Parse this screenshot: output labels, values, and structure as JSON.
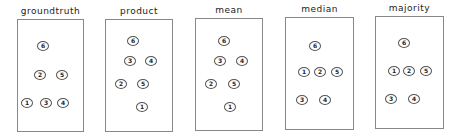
{
  "panels": [
    {
      "title": "groundtruth",
      "box": {
        "x": 17,
        "y": 19,
        "w": 67,
        "h": 113
      },
      "nodes": [
        {
          "label": "6",
          "x": 43,
          "y": 46
        },
        {
          "label": "2",
          "x": 40,
          "y": 75
        },
        {
          "label": "5",
          "x": 62,
          "y": 75
        },
        {
          "label": "1",
          "x": 27,
          "y": 103
        },
        {
          "label": "3",
          "x": 46,
          "y": 103
        },
        {
          "label": "4",
          "x": 63,
          "y": 103
        }
      ],
      "edges": [
        [
          "6",
          "2"
        ],
        [
          "6",
          "5"
        ],
        [
          "2",
          "1"
        ],
        [
          "2",
          "3"
        ],
        [
          "5",
          "3"
        ],
        [
          "5",
          "4"
        ]
      ]
    },
    {
      "title": "product",
      "box": {
        "x": 105,
        "y": 19,
        "w": 68,
        "h": 113
      },
      "nodes": [
        {
          "label": "6",
          "x": 133,
          "y": 41
        },
        {
          "label": "3",
          "x": 130,
          "y": 61
        },
        {
          "label": "4",
          "x": 151,
          "y": 61
        },
        {
          "label": "2",
          "x": 121,
          "y": 84
        },
        {
          "label": "5",
          "x": 143,
          "y": 84
        },
        {
          "label": "1",
          "x": 142,
          "y": 107
        }
      ],
      "edges": [
        [
          "6",
          "3"
        ],
        [
          "6",
          "4"
        ],
        [
          "3",
          "2"
        ],
        [
          "4",
          "5"
        ],
        [
          "3",
          "5"
        ],
        [
          "5",
          "1"
        ],
        [
          "2",
          "1"
        ]
      ]
    },
    {
      "title": "mean",
      "box": {
        "x": 195,
        "y": 18,
        "w": 68,
        "h": 113
      },
      "nodes": [
        {
          "label": "6",
          "x": 224,
          "y": 41
        },
        {
          "label": "3",
          "x": 220,
          "y": 61
        },
        {
          "label": "4",
          "x": 242,
          "y": 61
        },
        {
          "label": "2",
          "x": 211,
          "y": 84
        },
        {
          "label": "5",
          "x": 234,
          "y": 84
        },
        {
          "label": "1",
          "x": 230,
          "y": 107
        }
      ],
      "edges": [
        [
          "6",
          "3"
        ],
        [
          "6",
          "4"
        ],
        [
          "3",
          "2"
        ],
        [
          "4",
          "5"
        ],
        [
          "3",
          "5"
        ],
        [
          "5",
          "1"
        ],
        [
          "2",
          "1"
        ]
      ]
    },
    {
      "title": "median",
      "box": {
        "x": 285,
        "y": 17,
        "w": 69,
        "h": 113
      },
      "nodes": [
        {
          "label": "6",
          "x": 315,
          "y": 46
        },
        {
          "label": "1",
          "x": 304,
          "y": 72
        },
        {
          "label": "2",
          "x": 320,
          "y": 72
        },
        {
          "label": "5",
          "x": 337,
          "y": 72
        },
        {
          "label": "3",
          "x": 302,
          "y": 100
        },
        {
          "label": "4",
          "x": 325,
          "y": 100
        }
      ],
      "edges": [
        [
          "6",
          "1"
        ],
        [
          "6",
          "2"
        ],
        [
          "6",
          "5"
        ],
        [
          "1",
          "3"
        ],
        [
          "2",
          "3"
        ],
        [
          "2",
          "4"
        ],
        [
          "5",
          "4"
        ]
      ]
    },
    {
      "title": "majority",
      "box": {
        "x": 375,
        "y": 16,
        "w": 69,
        "h": 113
      },
      "nodes": [
        {
          "label": "6",
          "x": 404,
          "y": 43
        },
        {
          "label": "1",
          "x": 394,
          "y": 71
        },
        {
          "label": "2",
          "x": 409,
          "y": 71
        },
        {
          "label": "5",
          "x": 426,
          "y": 71
        },
        {
          "label": "3",
          "x": 391,
          "y": 99
        },
        {
          "label": "4",
          "x": 414,
          "y": 99
        }
      ],
      "edges": [
        [
          "6",
          "1"
        ],
        [
          "6",
          "2"
        ],
        [
          "6",
          "5"
        ],
        [
          "1",
          "3"
        ],
        [
          "2",
          "3"
        ],
        [
          "2",
          "4"
        ],
        [
          "5",
          "4"
        ]
      ]
    }
  ]
}
